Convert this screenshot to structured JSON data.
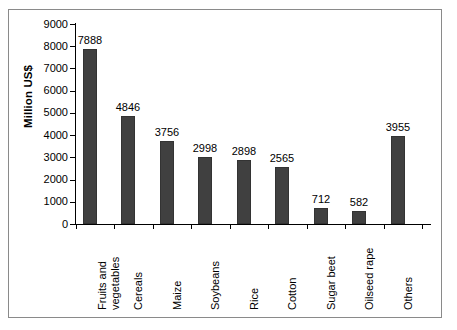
{
  "figure": {
    "background_color": "#ffffff",
    "frame_color": "#8a8a8a"
  },
  "chart_data": {
    "type": "bar",
    "title": "",
    "subtitle": "",
    "xlabel": "",
    "ylabel": "Million US$",
    "ylim": [
      0,
      9000
    ],
    "ytick_step": 1000,
    "yticks": [
      "9000",
      "8000",
      "7000",
      "6000",
      "5000",
      "4000",
      "3000",
      "2000",
      "1000",
      "0"
    ],
    "ytick_values": [
      9000,
      8000,
      7000,
      6000,
      5000,
      4000,
      3000,
      2000,
      1000,
      0
    ],
    "grid": false,
    "legend": false,
    "legend_position": "none",
    "bar_color": "#404040",
    "axis_color": "#000000",
    "categories": [
      "Fruits and vegetables",
      "Cereals",
      "Maize",
      "Soybeans",
      "Rice",
      "Cotton",
      "Sugar beet",
      "Oilseed rape",
      "Others"
    ],
    "category_lines": [
      [
        "Fruits and",
        "vegetables"
      ],
      [
        "Cereals"
      ],
      [
        "Maize"
      ],
      [
        "Soybeans"
      ],
      [
        "Rice"
      ],
      [
        "Cotton"
      ],
      [
        "Sugar beet"
      ],
      [
        "Oilseed rape"
      ],
      [
        "Others"
      ]
    ],
    "values": [
      7888,
      4846,
      3756,
      2998,
      2898,
      2565,
      712,
      582,
      3955
    ],
    "value_labels": [
      "7888",
      "4846",
      "3756",
      "2998",
      "2898",
      "2565",
      "712",
      "582",
      "3955"
    ],
    "bars": [
      {
        "category": "Fruits and vegetables",
        "value": 7888,
        "label": "7888"
      },
      {
        "category": "Cereals",
        "value": 4846,
        "label": "4846"
      },
      {
        "category": "Maize",
        "value": 3756,
        "label": "3756"
      },
      {
        "category": "Soybeans",
        "value": 2998,
        "label": "2998"
      },
      {
        "category": "Rice",
        "value": 2898,
        "label": "2898"
      },
      {
        "category": "Cotton",
        "value": 2565,
        "label": "2565"
      },
      {
        "category": "Sugar beet",
        "value": 712,
        "label": "712"
      },
      {
        "category": "Oilseed rape",
        "value": 582,
        "label": "582"
      },
      {
        "category": "Others",
        "value": 3955,
        "label": "3955"
      }
    ]
  }
}
